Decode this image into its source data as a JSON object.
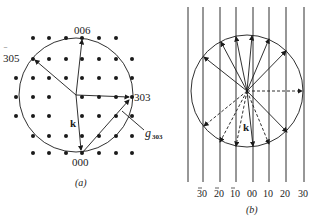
{
  "panel_a": {
    "caption": "(a)",
    "labels": {
      "top": "006",
      "left": "305",
      "left_bar": "‾",
      "right": "303",
      "bottom": "000",
      "k": "k",
      "g": "g",
      "g_sub": "303"
    },
    "dot_columns_x": [
      16,
      33,
      49,
      66,
      82,
      99,
      116,
      132
    ],
    "dot_rows_y": [
      38,
      59,
      78,
      97,
      116,
      136,
      153
    ]
  },
  "panel_b": {
    "caption": "(b)",
    "k": "k",
    "line_labels": [
      "30",
      "20",
      "10",
      "00",
      "10",
      "20",
      "30"
    ],
    "line_label_bars": [
      true,
      true,
      true,
      false,
      false,
      false,
      false
    ]
  },
  "colors": {
    "ink": "#1a1a1a",
    "background": "#ffffff"
  }
}
